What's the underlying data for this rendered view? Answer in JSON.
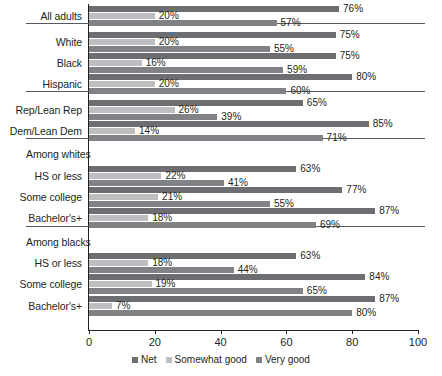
{
  "chart_data": {
    "type": "bar",
    "orientation": "horizontal",
    "title": "",
    "subtitle": "",
    "xlabel": "",
    "ylabel": "",
    "xlim": [
      0,
      100
    ],
    "xticks": [
      0,
      20,
      40,
      60,
      80,
      100
    ],
    "xtick_labels": [
      "0",
      "20",
      "40",
      "60",
      "80",
      "100"
    ],
    "grid": false,
    "legend_position": "bottom",
    "legend": [
      {
        "name": "Net",
        "color": "#6d6e71"
      },
      {
        "name": "Somewhat good",
        "color": "#bcbec0"
      },
      {
        "name": "Very good",
        "color": "#808285"
      }
    ],
    "series": [
      {
        "name": "Net",
        "values": [
          76,
          75,
          75,
          80,
          65,
          85,
          null,
          63,
          77,
          87,
          null,
          63,
          84,
          87
        ]
      },
      {
        "name": "Somewhat good",
        "values": [
          20,
          20,
          16,
          20,
          26,
          14,
          null,
          22,
          21,
          18,
          null,
          18,
          19,
          7
        ]
      },
      {
        "name": "Very good",
        "values": [
          57,
          55,
          59,
          60,
          39,
          71,
          null,
          41,
          55,
          69,
          null,
          44,
          65,
          80
        ]
      }
    ],
    "categories": [
      "All adults",
      "White",
      "Black",
      "Hispanic",
      "Rep/Lean Rep",
      "Dem/Lean Dem",
      "Among whites",
      "HS or less",
      "Some college",
      "Bachelor's+",
      "Among blacks",
      "HS or less",
      "Some college",
      "Bachelor's+"
    ]
  },
  "sections": [
    {
      "section_label": null,
      "rows": [
        {
          "label": "All adults",
          "net": 76,
          "somewhat": 20,
          "very": 57,
          "net_text": "76%",
          "somewhat_text": "20%",
          "very_text": "57%"
        }
      ]
    },
    {
      "section_label": null,
      "rows": [
        {
          "label": "White",
          "net": 75,
          "somewhat": 20,
          "very": 55,
          "net_text": "75%",
          "somewhat_text": "20%",
          "very_text": "55%"
        },
        {
          "label": "Black",
          "net": 75,
          "somewhat": 16,
          "very": 59,
          "net_text": "75%",
          "somewhat_text": "16%",
          "very_text": "59%"
        },
        {
          "label": "Hispanic",
          "net": 80,
          "somewhat": 20,
          "very": 60,
          "net_text": "80%",
          "somewhat_text": "20%",
          "very_text": "60%"
        }
      ]
    },
    {
      "section_label": null,
      "rows": [
        {
          "label": "Rep/Lean Rep",
          "net": 65,
          "somewhat": 26,
          "very": 39,
          "net_text": "65%",
          "somewhat_text": "26%",
          "very_text": "39%"
        },
        {
          "label": "Dem/Lean Dem",
          "net": 85,
          "somewhat": 14,
          "very": 71,
          "net_text": "85%",
          "somewhat_text": "14%",
          "very_text": "71%"
        }
      ]
    },
    {
      "section_label": "Among whites",
      "rows": [
        {
          "label": "HS or less",
          "net": 63,
          "somewhat": 22,
          "very": 41,
          "net_text": "63%",
          "somewhat_text": "22%",
          "very_text": "41%"
        },
        {
          "label": "Some college",
          "net": 77,
          "somewhat": 21,
          "very": 55,
          "net_text": "77%",
          "somewhat_text": "21%",
          "very_text": "55%"
        },
        {
          "label": "Bachelor's+",
          "net": 87,
          "somewhat": 18,
          "very": 69,
          "net_text": "87%",
          "somewhat_text": "18%",
          "very_text": "69%"
        }
      ]
    },
    {
      "section_label": "Among blacks",
      "rows": [
        {
          "label": "HS or less",
          "net": 63,
          "somewhat": 18,
          "very": 44,
          "net_text": "63%",
          "somewhat_text": "18%",
          "very_text": "44%"
        },
        {
          "label": "Some college",
          "net": 84,
          "somewhat": 19,
          "very": 65,
          "net_text": "84%",
          "somewhat_text": "19%",
          "very_text": "65%"
        },
        {
          "label": "Bachelor's+",
          "net": 87,
          "somewhat": 7,
          "very": 80,
          "net_text": "87%",
          "somewhat_text": "7%",
          "very_text": "80%"
        }
      ]
    }
  ],
  "axis": {
    "ticks": [
      {
        "value": 0,
        "label": "0"
      },
      {
        "value": 20,
        "label": "20"
      },
      {
        "value": 40,
        "label": "40"
      },
      {
        "value": 60,
        "label": "60"
      },
      {
        "value": 80,
        "label": "80"
      },
      {
        "value": 100,
        "label": "100"
      }
    ]
  },
  "colors": {
    "net": "#6d6e71",
    "somewhat": "#bcbec0",
    "very": "#808285",
    "axis": "#231f20",
    "rule": "#58595b",
    "background": "#ffffff"
  }
}
